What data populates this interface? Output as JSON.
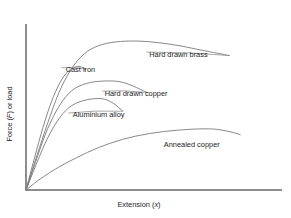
{
  "chart_data": {
    "type": "line",
    "title": "",
    "subtitle": "",
    "xlabel": "Extension (x)",
    "ylabel": "Force (F) or load",
    "xlabel_parts": {
      "text": "Extension (",
      "italic": "x",
      "tail": ")"
    },
    "ylabel_parts": {
      "head": "Force (",
      "italic": "F",
      "tail": ") or load"
    },
    "grid": false,
    "legend": "inline-annotations",
    "axis_ticks": false,
    "xlim": [
      0,
      1
    ],
    "ylim": [
      0,
      1
    ],
    "axis_color": "#8d8d8d",
    "curve_color": "#7a7a7a",
    "background_color": "#ffffff",
    "series": [
      {
        "name": "Hard drawn brass",
        "label": "Hard drawn brass",
        "label_x": 0.63,
        "label_y": 0.855,
        "leader": true,
        "peak_x": 0.46,
        "peak_y": 0.955,
        "end_x": 0.84,
        "end_y": 0.862,
        "points": [
          [
            0.0,
            0.0
          ],
          [
            0.045,
            0.22
          ],
          [
            0.09,
            0.43
          ],
          [
            0.135,
            0.62
          ],
          [
            0.185,
            0.77
          ],
          [
            0.24,
            0.872
          ],
          [
            0.3,
            0.925
          ],
          [
            0.37,
            0.949
          ],
          [
            0.46,
            0.955
          ],
          [
            0.55,
            0.944
          ],
          [
            0.64,
            0.923
          ],
          [
            0.73,
            0.895
          ],
          [
            0.84,
            0.862
          ]
        ]
      },
      {
        "name": "Cast iron",
        "label": "Cast iron",
        "label_x": 0.225,
        "label_y": 0.755,
        "leader": true,
        "peak_x": 0.215,
        "peak_y": 0.793,
        "end_x": 0.245,
        "end_y": 0.775,
        "points": [
          [
            0.0,
            0.0
          ],
          [
            0.035,
            0.205
          ],
          [
            0.07,
            0.4
          ],
          [
            0.105,
            0.565
          ],
          [
            0.14,
            0.687
          ],
          [
            0.175,
            0.762
          ],
          [
            0.215,
            0.793
          ],
          [
            0.245,
            0.775
          ]
        ]
      },
      {
        "name": "Hard drawn copper",
        "label": "Hard drawn copper",
        "label_x": 0.455,
        "label_y": 0.605,
        "leader": true,
        "peak_x": 0.385,
        "peak_y": 0.695,
        "end_x": 0.5,
        "end_y": 0.625,
        "points": [
          [
            0.0,
            0.0
          ],
          [
            0.045,
            0.205
          ],
          [
            0.09,
            0.395
          ],
          [
            0.14,
            0.545
          ],
          [
            0.19,
            0.638
          ],
          [
            0.25,
            0.683
          ],
          [
            0.315,
            0.698
          ],
          [
            0.385,
            0.695
          ],
          [
            0.44,
            0.668
          ],
          [
            0.5,
            0.625
          ]
        ]
      },
      {
        "name": "Aluminium alloy",
        "label": "Aluminium alloy",
        "label_x": 0.3,
        "label_y": 0.465,
        "leader": true,
        "peak_x": 0.315,
        "peak_y": 0.585,
        "end_x": 0.4,
        "end_y": 0.505,
        "points": [
          [
            0.0,
            0.0
          ],
          [
            0.045,
            0.175
          ],
          [
            0.09,
            0.335
          ],
          [
            0.14,
            0.465
          ],
          [
            0.19,
            0.542
          ],
          [
            0.25,
            0.578
          ],
          [
            0.315,
            0.585
          ],
          [
            0.36,
            0.556
          ],
          [
            0.4,
            0.505
          ]
        ]
      },
      {
        "name": "Annealed copper",
        "label": "Annealed copper",
        "label_x": 0.685,
        "label_y": 0.275,
        "leader": false,
        "peak_x": 0.755,
        "peak_y": 0.392,
        "end_x": 0.885,
        "end_y": 0.355,
        "points": [
          [
            0.0,
            0.0
          ],
          [
            0.06,
            0.072
          ],
          [
            0.13,
            0.142
          ],
          [
            0.21,
            0.208
          ],
          [
            0.3,
            0.272
          ],
          [
            0.4,
            0.325
          ],
          [
            0.51,
            0.362
          ],
          [
            0.63,
            0.384
          ],
          [
            0.755,
            0.392
          ],
          [
            0.83,
            0.378
          ],
          [
            0.885,
            0.355
          ]
        ]
      }
    ]
  }
}
